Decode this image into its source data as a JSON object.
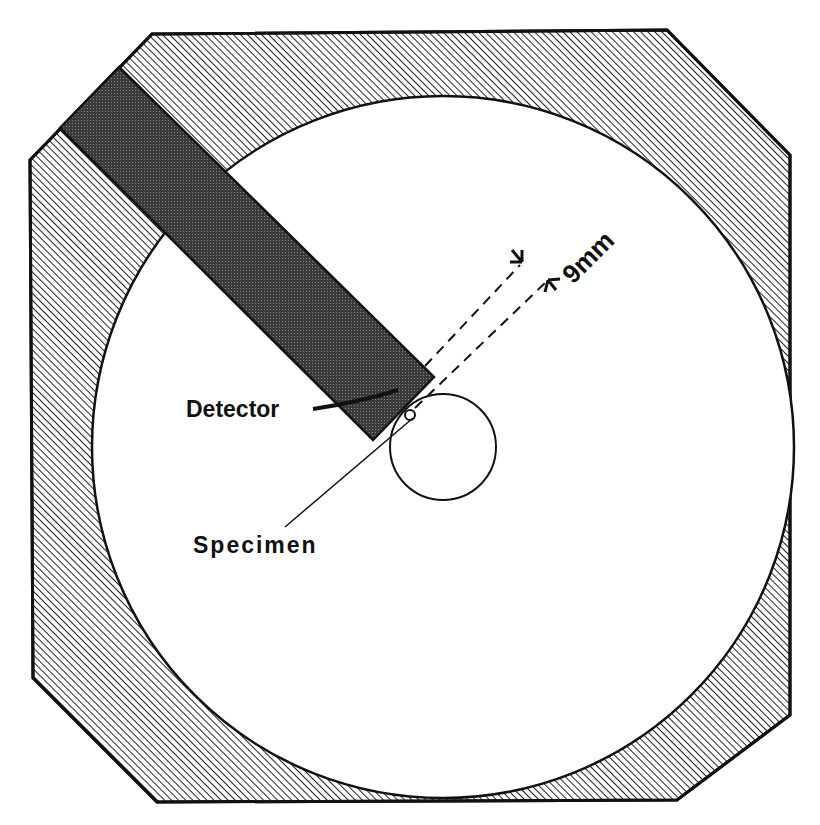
{
  "figure": {
    "labels": {
      "detector": "Detector",
      "specimen": "Specimen",
      "distance": "9mm"
    },
    "colors": {
      "ink": "#111111",
      "background": "#ffffff",
      "detector_fill": "#2a2a2a",
      "hatch": "#222222"
    },
    "components": [
      {
        "name": "octagonal-housing",
        "style": "diagonal hatching"
      },
      {
        "name": "circular-chamber",
        "style": "white interior"
      },
      {
        "name": "detector",
        "style": "dark stippled rectangular bar"
      },
      {
        "name": "specimen-holder-circle",
        "style": "outline circle"
      },
      {
        "name": "specimen",
        "style": "small open circle"
      },
      {
        "name": "dimension-lines",
        "style": "two dashed parallel lines with arrows"
      }
    ]
  }
}
